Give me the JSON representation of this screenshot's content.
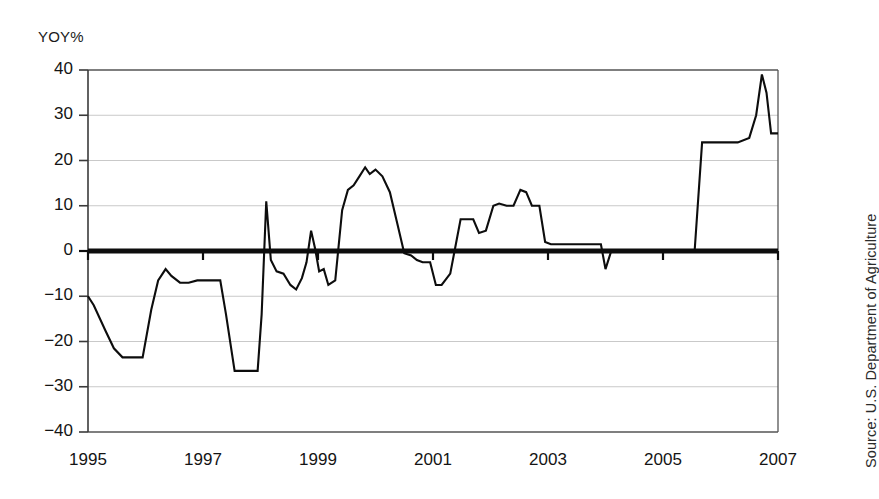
{
  "chart_data": {
    "type": "line",
    "title": "",
    "subtitle": "",
    "ylabel": "YOY%",
    "xlabel": "",
    "ylim": [
      -40,
      40
    ],
    "xlim": [
      1995,
      2007
    ],
    "yticks": [
      40,
      30,
      20,
      10,
      0,
      -10,
      -20,
      -30,
      -40
    ],
    "ytick_labels": [
      "40",
      "30",
      "20",
      "10",
      "0",
      "-10",
      "-20",
      "-30",
      "-40"
    ],
    "xticks": [
      1995,
      1997,
      1999,
      2001,
      2003,
      2005,
      2007
    ],
    "xtick_labels": [
      "1995",
      "1997",
      "1999",
      "2001",
      "2003",
      "2005",
      "2007"
    ],
    "grid": "horizontal",
    "legend": "none",
    "zero_line_emphasis": true,
    "source": "Source: U.S. Department of Agriculture",
    "series": [
      {
        "name": "YOY%",
        "color": "#0d0d0d",
        "x": [
          1995.0,
          1995.1,
          1995.3,
          1995.45,
          1995.6,
          1995.95,
          1996.1,
          1996.22,
          1996.35,
          1996.45,
          1996.6,
          1996.75,
          1996.9,
          1997.3,
          1997.4,
          1997.55,
          1997.95,
          1998.02,
          1998.1,
          1998.18,
          1998.28,
          1998.4,
          1998.52,
          1998.62,
          1998.72,
          1998.8,
          1998.88,
          1998.95,
          1999.02,
          1999.1,
          1999.18,
          1999.3,
          1999.42,
          1999.52,
          1999.62,
          1999.72,
          1999.82,
          1999.9,
          2000.0,
          2000.12,
          2000.25,
          2000.38,
          2000.5,
          2000.62,
          2000.72,
          2000.82,
          2000.95,
          2001.05,
          2001.15,
          2001.3,
          2001.48,
          2001.58,
          2001.7,
          2001.8,
          2001.92,
          2002.05,
          2002.15,
          2002.28,
          2002.4,
          2002.52,
          2002.62,
          2002.72,
          2002.85,
          2002.95,
          2003.05,
          2003.18,
          2003.35,
          2003.6,
          2003.8,
          2003.92,
          2004.0,
          2004.1,
          2004.25,
          2005.55,
          2005.68,
          2005.8,
          2006.3,
          2006.5,
          2006.62,
          2006.72,
          2006.8,
          2006.88,
          2006.95,
          2007.0
        ],
        "y": [
          -10.0,
          -12.0,
          -17.5,
          -21.5,
          -23.5,
          -23.5,
          -13.0,
          -6.5,
          -4.0,
          -5.5,
          -7.0,
          -7.0,
          -6.5,
          -6.5,
          -14.0,
          -26.5,
          -26.5,
          -14.0,
          11.0,
          -2.0,
          -4.5,
          -5.0,
          -7.5,
          -8.5,
          -6.0,
          -2.5,
          4.5,
          0.5,
          -4.5,
          -4.0,
          -7.5,
          -6.5,
          9.0,
          13.5,
          14.5,
          16.5,
          18.5,
          17.0,
          18.0,
          16.5,
          13.0,
          6.0,
          -0.5,
          -1.0,
          -2.0,
          -2.5,
          -2.5,
          -7.5,
          -7.5,
          -5.0,
          7.0,
          7.0,
          7.0,
          4.0,
          4.5,
          10.0,
          10.5,
          10.0,
          10.0,
          13.5,
          13.0,
          10.0,
          10.0,
          2.0,
          1.5,
          1.5,
          1.5,
          1.5,
          1.5,
          1.5,
          -4.0,
          0.0,
          0.0,
          0.0,
          24.0,
          24.0,
          24.0,
          25.0,
          30.0,
          39.0,
          35.0,
          26.0,
          26.0,
          26.0
        ]
      }
    ]
  },
  "axis": {
    "y_title": "YOY%"
  },
  "source": {
    "text": "Source: U.S. Department of Agriculture"
  }
}
